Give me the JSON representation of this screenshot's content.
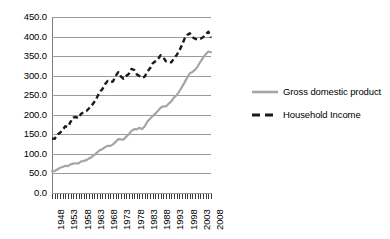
{
  "chart_data": {
    "type": "line",
    "title": "",
    "subtitle": "",
    "xlabel": "",
    "ylabel": "",
    "ylim": [
      0,
      450
    ],
    "ytick_step": 50,
    "ytick_labels": [
      "450.0",
      "400.0",
      "350.0",
      "300.0",
      "250.0",
      "200.0",
      "150.0",
      "100.0",
      "50.0",
      "0.0"
    ],
    "ytick_values": [
      450,
      400,
      350,
      300,
      250,
      200,
      150,
      100,
      50,
      0
    ],
    "grid": true,
    "grid_axis": "y",
    "legend_position": "right",
    "xlim": [
      1948,
      2008
    ],
    "xtick_labels": [
      "1948",
      "1953",
      "1958",
      "1963",
      "1968",
      "1973",
      "1978",
      "1983",
      "1988",
      "1993",
      "1998",
      "2003",
      "2008"
    ],
    "xtick_values": [
      1948,
      1953,
      1958,
      1963,
      1968,
      1973,
      1978,
      1983,
      1988,
      1993,
      1998,
      2003,
      2008
    ],
    "xtick_label_rotation": -90,
    "x": [
      1948,
      1949,
      1950,
      1951,
      1952,
      1953,
      1954,
      1955,
      1956,
      1957,
      1958,
      1959,
      1960,
      1961,
      1962,
      1963,
      1964,
      1965,
      1966,
      1967,
      1968,
      1969,
      1970,
      1971,
      1972,
      1973,
      1974,
      1975,
      1976,
      1977,
      1978,
      1979,
      1980,
      1981,
      1982,
      1983,
      1984,
      1985,
      1986,
      1987,
      1988,
      1989,
      1990,
      1991,
      1992,
      1993,
      1994,
      1995,
      1996,
      1997,
      1998,
      1999,
      2000,
      2001,
      2002,
      2003,
      2004,
      2005,
      2006,
      2007,
      2008
    ],
    "series": [
      {
        "name": "Gross domestic product",
        "color": "#a5a5a5",
        "style": "solid",
        "values": [
          100,
          101,
          108,
          116,
          120,
          125,
          124,
          132,
          135,
          137,
          136,
          145,
          148,
          151,
          159,
          166,
          175,
          186,
          197,
          202,
          211,
          217,
          217,
          224,
          235,
          248,
          247,
          246,
          259,
          271,
          286,
          294,
          293,
          300,
          294,
          307,
          329,
          342,
          354,
          365,
          379,
          392,
          399,
          398,
          411,
          422,
          439,
          450,
          467,
          487,
          508,
          531,
          551,
          557,
          567,
          583,
          604,
          622,
          639,
          651,
          648
        ]
      },
      {
        "name": "Household Income",
        "color": "#1a1a1a",
        "style": "dashed",
        "values": [
          100,
          99,
          107,
          110,
          115,
          122,
          121,
          130,
          138,
          139,
          137,
          145,
          148,
          150,
          155,
          160,
          167,
          175,
          185,
          190,
          199,
          205,
          203,
          204,
          214,
          221,
          213,
          209,
          214,
          218,
          227,
          225,
          217,
          214,
          211,
          213,
          222,
          228,
          237,
          241,
          245,
          252,
          248,
          241,
          240,
          239,
          246,
          252,
          260,
          270,
          282,
          289,
          292,
          285,
          282,
          281,
          282,
          285,
          290,
          295,
          284
        ]
      }
    ]
  },
  "legend": {
    "entries": [
      {
        "label": "Gross domestic product",
        "swatch": "solid-gray-line-swatch"
      },
      {
        "label": "Household Income",
        "swatch": "dashed-black-line-swatch"
      }
    ]
  },
  "colors": {
    "gdp_line": "#a5a5a5",
    "household_line": "#1a1a1a",
    "gridline": "#9a9a9a",
    "axis": "#7d7d7d",
    "background": "#ffffff",
    "text": "#000000"
  }
}
